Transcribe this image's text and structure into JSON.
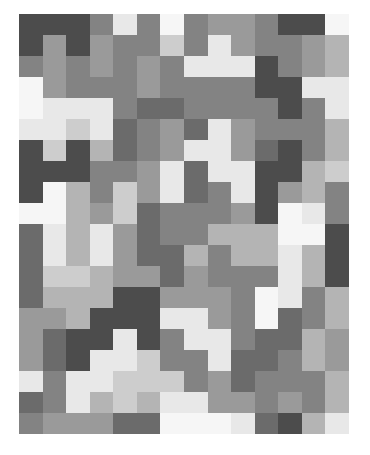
{
  "figure": {
    "title": "",
    "type": "grayscale-mosaic",
    "background_color": "#ffffff",
    "plot_area": {
      "x": 19,
      "y": 14,
      "width": 330,
      "height": 420
    },
    "grid": {
      "columns": 14,
      "rows": 20,
      "cell_width": 23.571,
      "cell_height": 21.0
    }
  },
  "palette": {
    "p0": "#4c4c4c",
    "p1": "#6b6b6b",
    "p2": "#838383",
    "p3": "#9a9a9a",
    "p4": "#b4b4b4",
    "p5": "#cdcdcd",
    "p6": "#e8e8e8",
    "p7": "#f6f6f6"
  },
  "chart_data": {
    "type": "heatmap",
    "title": "",
    "subtitle": "",
    "xlabel": "",
    "ylabel": "",
    "grid": false,
    "legend": "none",
    "axis_ranges": {
      "x": [
        0,
        14
      ],
      "y": [
        0,
        20
      ]
    },
    "tick_labels": {
      "x": [],
      "y": []
    },
    "annotations": [],
    "columns": [
      {
        "index": 0,
        "blocks": [
          {
            "span": 2,
            "shade": "p0"
          },
          {
            "span": 1,
            "shade": "p2"
          },
          {
            "span": 2,
            "shade": "p7"
          },
          {
            "span": 1,
            "shade": "p6"
          },
          {
            "span": 2,
            "shade": "p0"
          },
          {
            "span": 1,
            "shade": "p0"
          },
          {
            "span": 1,
            "shade": "p7"
          },
          {
            "span": 2,
            "shade": "p1"
          },
          {
            "span": 2,
            "shade": "p1"
          },
          {
            "span": 2,
            "shade": "p3"
          },
          {
            "span": 1,
            "shade": "p3"
          },
          {
            "span": 1,
            "shade": "p6"
          },
          {
            "span": 1,
            "shade": "p1"
          },
          {
            "span": 1,
            "shade": "p2"
          }
        ]
      },
      {
        "index": 1,
        "blocks": [
          {
            "span": 1,
            "shade": "p0"
          },
          {
            "span": 3,
            "shade": "p3"
          },
          {
            "span": 2,
            "shade": "p6"
          },
          {
            "span": 1,
            "shade": "p5"
          },
          {
            "span": 1,
            "shade": "p0"
          },
          {
            "span": 2,
            "shade": "p7"
          },
          {
            "span": 2,
            "shade": "p6"
          },
          {
            "span": 1,
            "shade": "p5"
          },
          {
            "span": 1,
            "shade": "p4"
          },
          {
            "span": 1,
            "shade": "p3"
          },
          {
            "span": 2,
            "shade": "p1"
          },
          {
            "span": 2,
            "shade": "p2"
          },
          {
            "span": 1,
            "shade": "p3"
          }
        ]
      },
      {
        "index": 2,
        "blocks": [
          {
            "span": 2,
            "shade": "p0"
          },
          {
            "span": 1,
            "shade": "p2"
          },
          {
            "span": 1,
            "shade": "p2"
          },
          {
            "span": 1,
            "shade": "p6"
          },
          {
            "span": 1,
            "shade": "p5"
          },
          {
            "span": 2,
            "shade": "p0"
          },
          {
            "span": 2,
            "shade": "p4"
          },
          {
            "span": 2,
            "shade": "p4"
          },
          {
            "span": 1,
            "shade": "p5"
          },
          {
            "span": 2,
            "shade": "p4"
          },
          {
            "span": 2,
            "shade": "p0"
          },
          {
            "span": 2,
            "shade": "p6"
          },
          {
            "span": 1,
            "shade": "p3"
          }
        ]
      },
      {
        "index": 3,
        "blocks": [
          {
            "span": 1,
            "shade": "p2"
          },
          {
            "span": 2,
            "shade": "p3"
          },
          {
            "span": 1,
            "shade": "p2"
          },
          {
            "span": 2,
            "shade": "p6"
          },
          {
            "span": 1,
            "shade": "p4"
          },
          {
            "span": 2,
            "shade": "p2"
          },
          {
            "span": 1,
            "shade": "p3"
          },
          {
            "span": 2,
            "shade": "p6"
          },
          {
            "span": 2,
            "shade": "p4"
          },
          {
            "span": 2,
            "shade": "p0"
          },
          {
            "span": 1,
            "shade": "p6"
          },
          {
            "span": 1,
            "shade": "p6"
          },
          {
            "span": 1,
            "shade": "p4"
          },
          {
            "span": 1,
            "shade": "p3"
          }
        ]
      },
      {
        "index": 4,
        "blocks": [
          {
            "span": 1,
            "shade": "p6"
          },
          {
            "span": 2,
            "shade": "p2"
          },
          {
            "span": 2,
            "shade": "p2"
          },
          {
            "span": 2,
            "shade": "p1"
          },
          {
            "span": 1,
            "shade": "p2"
          },
          {
            "span": 2,
            "shade": "p5"
          },
          {
            "span": 2,
            "shade": "p3"
          },
          {
            "span": 1,
            "shade": "p3"
          },
          {
            "span": 2,
            "shade": "p0"
          },
          {
            "span": 2,
            "shade": "p6"
          },
          {
            "span": 2,
            "shade": "p5"
          },
          {
            "span": 1,
            "shade": "p1"
          }
        ]
      },
      {
        "index": 5,
        "blocks": [
          {
            "span": 2,
            "shade": "p2"
          },
          {
            "span": 2,
            "shade": "p3"
          },
          {
            "span": 1,
            "shade": "p1"
          },
          {
            "span": 2,
            "shade": "p2"
          },
          {
            "span": 2,
            "shade": "p3"
          },
          {
            "span": 1,
            "shade": "p1"
          },
          {
            "span": 2,
            "shade": "p1"
          },
          {
            "span": 1,
            "shade": "p3"
          },
          {
            "span": 2,
            "shade": "p0"
          },
          {
            "span": 1,
            "shade": "p0"
          },
          {
            "span": 2,
            "shade": "p5"
          },
          {
            "span": 1,
            "shade": "p4"
          },
          {
            "span": 1,
            "shade": "p1"
          }
        ]
      },
      {
        "index": 6,
        "blocks": [
          {
            "span": 1,
            "shade": "p7"
          },
          {
            "span": 1,
            "shade": "p5"
          },
          {
            "span": 2,
            "shade": "p2"
          },
          {
            "span": 1,
            "shade": "p1"
          },
          {
            "span": 2,
            "shade": "p3"
          },
          {
            "span": 2,
            "shade": "p6"
          },
          {
            "span": 2,
            "shade": "p2"
          },
          {
            "span": 2,
            "shade": "p1"
          },
          {
            "span": 1,
            "shade": "p3"
          },
          {
            "span": 1,
            "shade": "p6"
          },
          {
            "span": 2,
            "shade": "p2"
          },
          {
            "span": 1,
            "shade": "p5"
          },
          {
            "span": 1,
            "shade": "p6"
          },
          {
            "span": 1,
            "shade": "p7"
          }
        ]
      },
      {
        "index": 7,
        "blocks": [
          {
            "span": 2,
            "shade": "p2"
          },
          {
            "span": 1,
            "shade": "p6"
          },
          {
            "span": 2,
            "shade": "p2"
          },
          {
            "span": 1,
            "shade": "p1"
          },
          {
            "span": 1,
            "shade": "p6"
          },
          {
            "span": 2,
            "shade": "p1"
          },
          {
            "span": 2,
            "shade": "p2"
          },
          {
            "span": 1,
            "shade": "p4"
          },
          {
            "span": 2,
            "shade": "p3"
          },
          {
            "span": 2,
            "shade": "p6"
          },
          {
            "span": 2,
            "shade": "p2"
          },
          {
            "span": 1,
            "shade": "p6"
          },
          {
            "span": 1,
            "shade": "p7"
          }
        ]
      },
      {
        "index": 8,
        "blocks": [
          {
            "span": 1,
            "shade": "p3"
          },
          {
            "span": 2,
            "shade": "p6"
          },
          {
            "span": 2,
            "shade": "p2"
          },
          {
            "span": 2,
            "shade": "p6"
          },
          {
            "span": 1,
            "shade": "p6"
          },
          {
            "span": 2,
            "shade": "p2"
          },
          {
            "span": 1,
            "shade": "p4"
          },
          {
            "span": 2,
            "shade": "p2"
          },
          {
            "span": 2,
            "shade": "p3"
          },
          {
            "span": 2,
            "shade": "p6"
          },
          {
            "span": 2,
            "shade": "p3"
          },
          {
            "span": 1,
            "shade": "p7"
          }
        ]
      },
      {
        "index": 9,
        "blocks": [
          {
            "span": 2,
            "shade": "p3"
          },
          {
            "span": 1,
            "shade": "p6"
          },
          {
            "span": 2,
            "shade": "p2"
          },
          {
            "span": 2,
            "shade": "p3"
          },
          {
            "span": 2,
            "shade": "p6"
          },
          {
            "span": 1,
            "shade": "p3"
          },
          {
            "span": 2,
            "shade": "p4"
          },
          {
            "span": 2,
            "shade": "p2"
          },
          {
            "span": 2,
            "shade": "p2"
          },
          {
            "span": 2,
            "shade": "p1"
          },
          {
            "span": 1,
            "shade": "p3"
          },
          {
            "span": 1,
            "shade": "p6"
          }
        ]
      },
      {
        "index": 10,
        "blocks": [
          {
            "span": 2,
            "shade": "p2"
          },
          {
            "span": 2,
            "shade": "p0"
          },
          {
            "span": 2,
            "shade": "p2"
          },
          {
            "span": 1,
            "shade": "p1"
          },
          {
            "span": 2,
            "shade": "p0"
          },
          {
            "span": 1,
            "shade": "p0"
          },
          {
            "span": 2,
            "shade": "p4"
          },
          {
            "span": 1,
            "shade": "p2"
          },
          {
            "span": 2,
            "shade": "p7"
          },
          {
            "span": 2,
            "shade": "p1"
          },
          {
            "span": 2,
            "shade": "p2"
          },
          {
            "span": 1,
            "shade": "p1"
          }
        ]
      },
      {
        "index": 11,
        "blocks": [
          {
            "span": 1,
            "shade": "p0"
          },
          {
            "span": 2,
            "shade": "p2"
          },
          {
            "span": 2,
            "shade": "p0"
          },
          {
            "span": 1,
            "shade": "p2"
          },
          {
            "span": 2,
            "shade": "p0"
          },
          {
            "span": 1,
            "shade": "p3"
          },
          {
            "span": 2,
            "shade": "p7"
          },
          {
            "span": 2,
            "shade": "p6"
          },
          {
            "span": 1,
            "shade": "p6"
          },
          {
            "span": 2,
            "shade": "p1"
          },
          {
            "span": 2,
            "shade": "p2"
          },
          {
            "span": 1,
            "shade": "p3"
          },
          {
            "span": 1,
            "shade": "p0"
          }
        ]
      },
      {
        "index": 12,
        "blocks": [
          {
            "span": 1,
            "shade": "p0"
          },
          {
            "span": 2,
            "shade": "p3"
          },
          {
            "span": 1,
            "shade": "p6"
          },
          {
            "span": 1,
            "shade": "p2"
          },
          {
            "span": 2,
            "shade": "p2"
          },
          {
            "span": 2,
            "shade": "p4"
          },
          {
            "span": 1,
            "shade": "p6"
          },
          {
            "span": 1,
            "shade": "p7"
          },
          {
            "span": 2,
            "shade": "p4"
          },
          {
            "span": 2,
            "shade": "p2"
          },
          {
            "span": 2,
            "shade": "p4"
          },
          {
            "span": 2,
            "shade": "p2"
          },
          {
            "span": 1,
            "shade": "p4"
          }
        ]
      },
      {
        "index": 13,
        "blocks": [
          {
            "span": 1,
            "shade": "p7"
          },
          {
            "span": 2,
            "shade": "p4"
          },
          {
            "span": 2,
            "shade": "p6"
          },
          {
            "span": 2,
            "shade": "p4"
          },
          {
            "span": 1,
            "shade": "p5"
          },
          {
            "span": 2,
            "shade": "p2"
          },
          {
            "span": 2,
            "shade": "p0"
          },
          {
            "span": 1,
            "shade": "p0"
          },
          {
            "span": 2,
            "shade": "p4"
          },
          {
            "span": 2,
            "shade": "p3"
          },
          {
            "span": 2,
            "shade": "p4"
          },
          {
            "span": 1,
            "shade": "p6"
          }
        ]
      }
    ]
  }
}
